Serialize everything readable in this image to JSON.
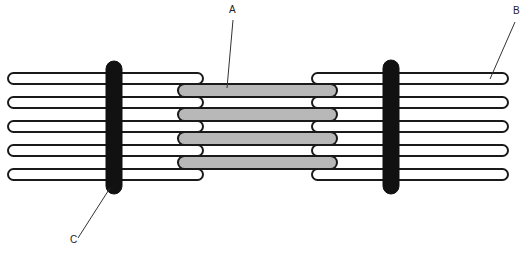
{
  "diagram": {
    "labels": [
      {
        "id": "A",
        "text": "A",
        "target": "thick-filament",
        "x": 229,
        "y": 9,
        "line": [
          233,
          20,
          227,
          88
        ]
      },
      {
        "id": "B",
        "text": "B",
        "target": "thin-filament",
        "x": 515,
        "y": 10,
        "line": [
          515,
          22,
          490,
          79
        ]
      },
      {
        "id": "C",
        "text": "C",
        "target": "z-line",
        "x": 71,
        "y": 240,
        "line": [
          78,
          238,
          110,
          188
        ]
      }
    ],
    "colors": {
      "outline": "#1a1a1a",
      "thick_fill": "#b8b8b8",
      "thin_fill": "#ffffff",
      "z_line": "#111111"
    },
    "thin_filaments_left": [
      {
        "x1": 8,
        "x2": 203,
        "y": 73,
        "h": 11
      },
      {
        "x1": 8,
        "x2": 203,
        "y": 97,
        "h": 11
      },
      {
        "x1": 8,
        "x2": 203,
        "y": 121,
        "h": 11
      },
      {
        "x1": 8,
        "x2": 203,
        "y": 145,
        "h": 11
      },
      {
        "x1": 8,
        "x2": 203,
        "y": 169,
        "h": 11
      }
    ],
    "thin_filaments_right": [
      {
        "x1": 312,
        "x2": 508,
        "y": 73,
        "h": 11
      },
      {
        "x1": 312,
        "x2": 508,
        "y": 97,
        "h": 11
      },
      {
        "x1": 312,
        "x2": 508,
        "y": 121,
        "h": 11
      },
      {
        "x1": 312,
        "x2": 508,
        "y": 145,
        "h": 11
      },
      {
        "x1": 312,
        "x2": 508,
        "y": 169,
        "h": 11
      }
    ],
    "thick_filaments": [
      {
        "x1": 178,
        "x2": 337,
        "y": 84,
        "h": 13
      },
      {
        "x1": 178,
        "x2": 337,
        "y": 108,
        "h": 13
      },
      {
        "x1": 178,
        "x2": 337,
        "y": 132,
        "h": 13
      },
      {
        "x1": 178,
        "x2": 337,
        "y": 156,
        "h": 13
      }
    ],
    "z_lines": [
      {
        "x": 106,
        "w": 16,
        "y1": 61,
        "y2": 194
      },
      {
        "x": 383,
        "w": 16,
        "y1": 60,
        "y2": 194
      }
    ]
  }
}
